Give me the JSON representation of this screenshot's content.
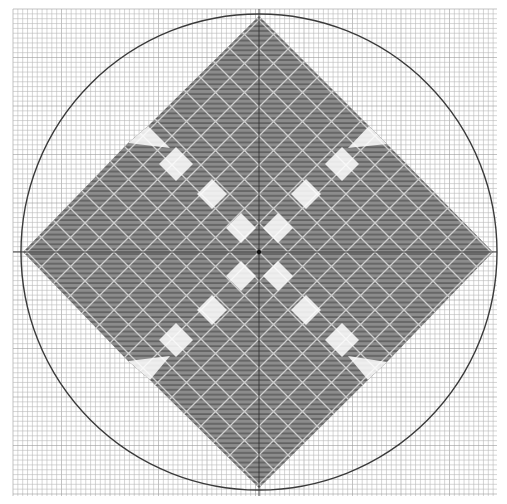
{
  "figure": {
    "width": 507,
    "height": 504,
    "background": "#ffffff",
    "grid": {
      "x0": 13,
      "y0": 9,
      "x1": 497,
      "y1": 496,
      "cell": 4.85,
      "line_color": "#b8b8b8",
      "major_every": 10,
      "major_color": "#9a9a9a"
    },
    "axes": {
      "center_x": 259,
      "center_y": 252,
      "color": "#333333"
    },
    "circle": {
      "cx": 259,
      "cy": 252,
      "r": 238,
      "stroke": "#3a3a3a",
      "stroke_width": 1.4
    },
    "pattern": {
      "fill": "#8c8c8c",
      "stripe_color": "#5e5e5e",
      "lattice_color": "#c8c8c8",
      "hole_fill": "#ffffff"
    },
    "shape": {
      "outline": [
        [
          259,
          16
        ],
        [
          369,
          126
        ],
        [
          387,
          144
        ],
        [
          493,
          252
        ],
        [
          387,
          362
        ],
        [
          368,
          380
        ],
        [
          259,
          488
        ],
        [
          150,
          380
        ],
        [
          128,
          361
        ],
        [
          23,
          252
        ],
        [
          128,
          143
        ],
        [
          148,
          126
        ]
      ],
      "notches": [
        [
          [
            148,
            126
          ],
          [
            128,
            143
          ],
          [
            170,
            148
          ]
        ],
        [
          [
            369,
            126
          ],
          [
            387,
            144
          ],
          [
            348,
            148
          ]
        ],
        [
          [
            387,
            362
          ],
          [
            368,
            380
          ],
          [
            348,
            356
          ]
        ],
        [
          [
            150,
            380
          ],
          [
            128,
            361
          ],
          [
            170,
            356
          ]
        ]
      ],
      "holes": [
        {
          "cx": 176,
          "cy": 164,
          "r": 17
        },
        {
          "cx": 212,
          "cy": 194,
          "r": 15
        },
        {
          "cx": 241,
          "cy": 228,
          "r": 15
        },
        {
          "cx": 342,
          "cy": 164,
          "r": 17
        },
        {
          "cx": 306,
          "cy": 194,
          "r": 15
        },
        {
          "cx": 278,
          "cy": 228,
          "r": 15
        },
        {
          "cx": 176,
          "cy": 340,
          "r": 17
        },
        {
          "cx": 212,
          "cy": 310,
          "r": 15
        },
        {
          "cx": 241,
          "cy": 276,
          "r": 15
        },
        {
          "cx": 342,
          "cy": 340,
          "r": 17
        },
        {
          "cx": 306,
          "cy": 310,
          "r": 15
        },
        {
          "cx": 278,
          "cy": 276,
          "r": 15
        }
      ]
    }
  }
}
